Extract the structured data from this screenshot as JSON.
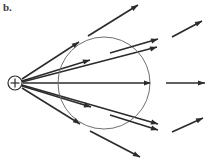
{
  "figure": {
    "panel_label": "b.",
    "width": 205,
    "height": 158,
    "background_color": "#ffffff",
    "line_color": "#2b2b2b",
    "surface_color": "#6e6e6e"
  },
  "charge": {
    "symbol": "+",
    "center_x": 15,
    "center_y": 83,
    "radius": 7,
    "sign": "positive",
    "label_name": "positive-point-charge"
  },
  "gaussian_surface": {
    "shape": "circle",
    "center_x": 104,
    "center_y": 83,
    "radius": 46,
    "stroke_color": "#6e6e6e"
  },
  "field_lines": [
    {
      "id": "ray-up-steep",
      "angle_deg": -39,
      "inner_start_x": 22,
      "inner_start_y": 79,
      "arrow_x": 79,
      "arrow_y": 42,
      "outer_start_x": 88,
      "outer_start_y": 36,
      "outer_end_x": 138,
      "outer_end_y": 5,
      "has_outer_segment": true
    },
    {
      "id": "ray-up-mid",
      "angle_deg": -22,
      "inner_start_x": 22,
      "inner_start_y": 81,
      "arrow_x": 90,
      "arrow_y": 60,
      "outer_start_x": 110,
      "outer_start_y": 53,
      "outer_end_x": 158,
      "outer_end_y": 39,
      "has_outer_segment": true
    },
    {
      "id": "ray-up-shallow",
      "angle_deg": -14,
      "inner_start_x": 22,
      "inner_start_y": 82,
      "arrow_x": 157,
      "arrow_y": 47,
      "outer_start_x": 172,
      "outer_start_y": 37,
      "outer_end_x": 202,
      "outer_end_y": 21,
      "has_outer_segment": true
    },
    {
      "id": "ray-horizontal",
      "angle_deg": 0,
      "inner_start_x": 23,
      "inner_start_y": 83,
      "arrow_x": 150,
      "arrow_y": 83,
      "outer_start_x": 166,
      "outer_start_y": 83,
      "outer_end_x": 205,
      "outer_end_y": 83,
      "has_outer_segment": true
    },
    {
      "id": "ray-down-shallow",
      "angle_deg": 14,
      "inner_start_x": 22,
      "inner_start_y": 85,
      "arrow_x": 158,
      "arrow_y": 124,
      "outer_start_x": 172,
      "outer_start_y": 132,
      "outer_end_x": 203,
      "outer_end_y": 118,
      "has_outer_segment": true
    },
    {
      "id": "ray-down-mid",
      "angle_deg": 22,
      "inner_start_x": 22,
      "inner_start_y": 86,
      "arrow_x": 91,
      "arrow_y": 107,
      "outer_start_x": 110,
      "outer_start_y": 115,
      "outer_end_x": 158,
      "outer_end_y": 130,
      "has_outer_segment": true
    },
    {
      "id": "ray-down-steep",
      "angle_deg": 39,
      "inner_start_x": 22,
      "inner_start_y": 88,
      "arrow_x": 80,
      "arrow_y": 124,
      "outer_start_x": 90,
      "outer_start_y": 131,
      "outer_end_x": 140,
      "outer_end_y": 157,
      "has_outer_segment": true
    }
  ],
  "arrow_marks": [
    {
      "id": "arrowhead-up-steep",
      "x": 79,
      "y": 42,
      "angle_deg": -33
    },
    {
      "id": "arrowhead-up-mid",
      "x": 90,
      "y": 60,
      "angle_deg": -17
    },
    {
      "id": "arrowhead-up-shallow",
      "x": 157,
      "y": 47,
      "angle_deg": -17
    },
    {
      "id": "arrowhead-horizontal",
      "x": 151,
      "y": 83,
      "angle_deg": 0
    },
    {
      "id": "arrowhead-down-shallow",
      "x": 158,
      "y": 124,
      "angle_deg": 17
    },
    {
      "id": "arrowhead-down-mid",
      "x": 91,
      "y": 107,
      "angle_deg": 17
    },
    {
      "id": "arrowhead-down-steep",
      "x": 80,
      "y": 124,
      "angle_deg": 33
    },
    {
      "id": "arrowhead-outer-up-steep",
      "x": 138,
      "y": 5,
      "angle_deg": -33
    },
    {
      "id": "arrowhead-outer-up-mid",
      "x": 158,
      "y": 39,
      "angle_deg": -17
    },
    {
      "id": "arrowhead-outer-up-shallow",
      "x": 202,
      "y": 21,
      "angle_deg": -28
    },
    {
      "id": "arrowhead-outer-horizontal",
      "x": 205,
      "y": 83,
      "angle_deg": 0
    },
    {
      "id": "arrowhead-outer-down-shallow",
      "x": 203,
      "y": 118,
      "angle_deg": -25
    },
    {
      "id": "arrowhead-outer-down-mid",
      "x": 158,
      "y": 130,
      "angle_deg": 17
    },
    {
      "id": "arrowhead-outer-down-steep",
      "x": 140,
      "y": 157,
      "angle_deg": 28
    }
  ]
}
